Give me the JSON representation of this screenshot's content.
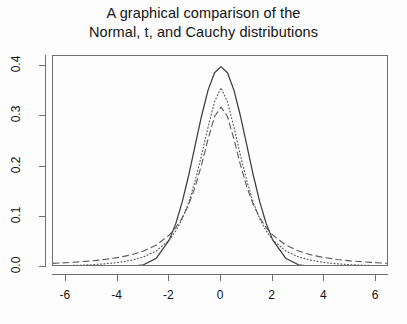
{
  "chart_data": {
    "type": "line",
    "title": "A graphical comparison of the\nNormal, t, and Cauchy distributions",
    "title_line1": "A graphical comparison of the",
    "title_line2": "Normal, t, and Cauchy distributions",
    "xlabel": "",
    "ylabel": "",
    "xlim": [
      -6.5,
      6.5
    ],
    "ylim": [
      0.0,
      0.42
    ],
    "grid": false,
    "legend_position": "none",
    "xticks": [
      -6,
      -4,
      -2,
      0,
      2,
      4,
      6
    ],
    "xtick_labels": [
      "-6",
      "-4",
      "-2",
      "0",
      "2",
      "4",
      "6"
    ],
    "yticks": [
      0.0,
      0.1,
      0.2,
      0.3,
      0.4
    ],
    "ytick_labels": [
      "0.0",
      "0.1",
      "0.2",
      "0.3",
      "0.4"
    ],
    "x": [
      -6.5,
      -6.0,
      -5.5,
      -5.0,
      -4.5,
      -4.0,
      -3.5,
      -3.0,
      -2.5,
      -2.0,
      -1.75,
      -1.5,
      -1.25,
      -1.0,
      -0.75,
      -0.5,
      -0.25,
      0.0,
      0.25,
      0.5,
      0.75,
      1.0,
      1.25,
      1.5,
      1.75,
      2.0,
      2.5,
      3.0,
      3.5,
      4.0,
      4.5,
      5.0,
      5.5,
      6.0,
      6.5
    ],
    "series": [
      {
        "name": "Normal",
        "style": "solid",
        "color": "#3c3c3c",
        "values": [
          0.0,
          0.0,
          0.0,
          0.0,
          0.0,
          0.0001,
          0.0009,
          0.0044,
          0.0175,
          0.054,
          0.0863,
          0.1295,
          0.1826,
          0.242,
          0.3011,
          0.3521,
          0.3867,
          0.3989,
          0.3867,
          0.3521,
          0.3011,
          0.242,
          0.1826,
          0.1295,
          0.0863,
          0.054,
          0.0175,
          0.0044,
          0.0009,
          0.0001,
          0.0,
          0.0,
          0.0,
          0.0,
          0.0
        ]
      },
      {
        "name": "t",
        "style": "dotted",
        "color": "#555555",
        "values": [
          0.0021,
          0.0027,
          0.0035,
          0.0046,
          0.0063,
          0.0089,
          0.0131,
          0.02,
          0.032,
          0.054,
          0.0716,
          0.0958,
          0.1286,
          0.1713,
          0.2228,
          0.2783,
          0.3291,
          0.3568,
          0.3291,
          0.2783,
          0.2228,
          0.1713,
          0.1286,
          0.0958,
          0.0716,
          0.054,
          0.032,
          0.02,
          0.0131,
          0.0089,
          0.0063,
          0.0046,
          0.0035,
          0.0027,
          0.0021
        ]
      },
      {
        "name": "Cauchy",
        "style": "dashed",
        "color": "#5a5a5a",
        "values": [
          0.0072,
          0.0086,
          0.0103,
          0.0122,
          0.015,
          0.0187,
          0.0239,
          0.0318,
          0.0439,
          0.0637,
          0.0784,
          0.098,
          0.1242,
          0.1592,
          0.2037,
          0.2546,
          0.2996,
          0.3183,
          0.2996,
          0.2546,
          0.2037,
          0.1592,
          0.1242,
          0.098,
          0.0784,
          0.0637,
          0.0439,
          0.0318,
          0.0239,
          0.0187,
          0.015,
          0.0122,
          0.0103,
          0.0086,
          0.0072
        ]
      }
    ]
  }
}
